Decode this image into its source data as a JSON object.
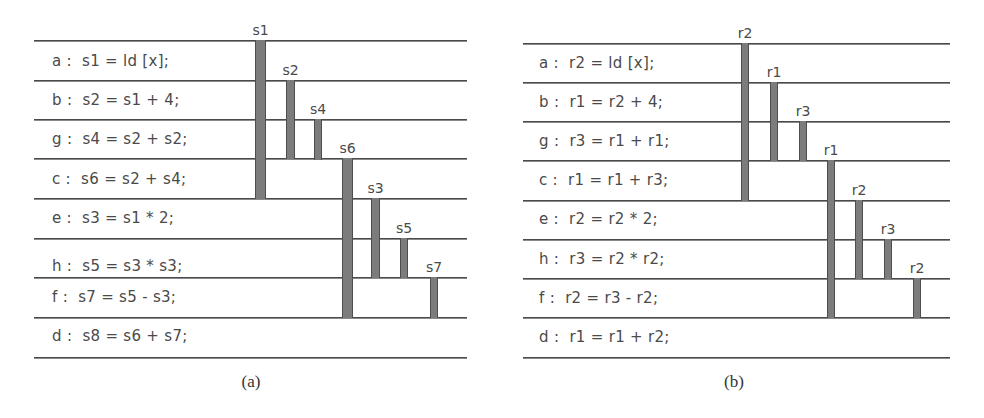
{
  "colors": {
    "line": "#4a4a4a",
    "bar_fill": "#7c7c7c",
    "bar_edge": "#4e4e4e",
    "text": "#4a4a4a"
  },
  "panels": [
    {
      "id": "a",
      "caption": "(a)",
      "caption_x": 221,
      "line_left": 34,
      "line_right": 467,
      "text_left": 52,
      "line_ys": [
        40,
        80,
        119,
        158,
        198,
        238,
        277,
        317,
        357
      ],
      "instructions": [
        {
          "label": "a",
          "text": "a :  s1 = ld [x];",
          "y": 52
        },
        {
          "label": "b",
          "text": "b :  s2 = s1 + 4;",
          "y": 91
        },
        {
          "label": "g",
          "text": "g :  s4 = s2 + s2;",
          "y": 130
        },
        {
          "label": "c",
          "text": "c :  s6 = s2 + s4;",
          "y": 170
        },
        {
          "label": "e",
          "text": "e :  s3 = s1 * 2;",
          "y": 209
        },
        {
          "label": "h",
          "text": "h :  s5 = s3 * s3;",
          "y": 257
        },
        {
          "label": "f",
          "text": "f :  s7 = s5 - s3;",
          "y": 288
        },
        {
          "label": "d",
          "text": "d :  s8 = s6 + s7;",
          "y": 327
        }
      ],
      "live_ranges": [
        {
          "name": "s1",
          "x": 255,
          "width": 11,
          "top": 40,
          "bottom": 198
        },
        {
          "name": "s2",
          "x": 286,
          "width": 9,
          "top": 80,
          "bottom": 158
        },
        {
          "name": "s4",
          "x": 314,
          "width": 8,
          "top": 119,
          "bottom": 159
        },
        {
          "name": "s6",
          "x": 342,
          "width": 11,
          "top": 158,
          "bottom": 317
        },
        {
          "name": "s3",
          "x": 371,
          "width": 9,
          "top": 198,
          "bottom": 277
        },
        {
          "name": "s5",
          "x": 400,
          "width": 8,
          "top": 238,
          "bottom": 277
        },
        {
          "name": "s7",
          "x": 430,
          "width": 8,
          "top": 277,
          "bottom": 317
        }
      ]
    },
    {
      "id": "b",
      "caption": "(b)",
      "caption_x": 704,
      "line_left": 523,
      "line_right": 950,
      "text_left": 539,
      "line_ys": [
        43,
        82,
        121,
        160,
        200,
        239,
        278,
        317,
        357
      ],
      "instructions": [
        {
          "label": "a",
          "text": "a :  r2 = ld [x];",
          "y": 54
        },
        {
          "label": "b",
          "text": "b :  r1 = r2 + 4;",
          "y": 93
        },
        {
          "label": "g",
          "text": "g :  r3 = r1 + r1;",
          "y": 132
        },
        {
          "label": "c",
          "text": "c :  r1 = r1 + r3;",
          "y": 171
        },
        {
          "label": "e",
          "text": "e :  r2 = r2 * 2;",
          "y": 210
        },
        {
          "label": "h",
          "text": "h :  r3 = r2 * r2;",
          "y": 250
        },
        {
          "label": "f",
          "text": "f :  r2 = r3 - r2;",
          "y": 289
        },
        {
          "label": "d",
          "text": "d :  r1 = r1 + r2;",
          "y": 328
        }
      ],
      "live_ranges": [
        {
          "name": "r2",
          "x": 741,
          "width": 8,
          "top": 43,
          "bottom": 200
        },
        {
          "name": "r1",
          "x": 770,
          "width": 8,
          "top": 82,
          "bottom": 160
        },
        {
          "name": "r3",
          "x": 799,
          "width": 8,
          "top": 121,
          "bottom": 160
        },
        {
          "name": "r1",
          "x": 827,
          "width": 8,
          "top": 160,
          "bottom": 317
        },
        {
          "name": "r2",
          "x": 855,
          "width": 8,
          "top": 200,
          "bottom": 278
        },
        {
          "name": "r3",
          "x": 884,
          "width": 8,
          "top": 239,
          "bottom": 278
        },
        {
          "name": "r2",
          "x": 913,
          "width": 8,
          "top": 278,
          "bottom": 317
        }
      ]
    }
  ]
}
